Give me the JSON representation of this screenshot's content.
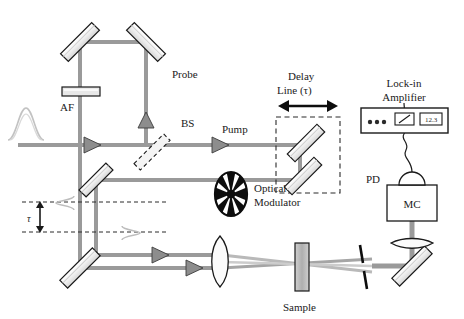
{
  "figure": {
    "type": "optical-setup-diagram",
    "background": "#ffffff"
  },
  "colors": {
    "beam": "#9a9a9a",
    "beam_light": "#c9c9c9",
    "outline": "#1a1a1a",
    "mirror_face": "#eeeeee",
    "component_fill": "#b5b5b5",
    "text": "#1a1a1a",
    "dashed": "#2a2a2a"
  },
  "labels": {
    "probe": "Probe",
    "pump": "Pump",
    "af": "AF",
    "bs": "BS",
    "delay_line": "Delay",
    "delay_line_2": "Line (τ)",
    "lockin": "Lock-in",
    "lockin_2": "Amplifier",
    "optical_modulator": "Optical",
    "optical_modulator_2": "Modulator",
    "pd": "PD",
    "mc": "MC",
    "sample": "Sample",
    "tau": "τ"
  },
  "lockin_amplifier": {
    "display_value": "12.3",
    "knob_count": 3,
    "meter": "analog-needle-meter"
  },
  "components": [
    {
      "name": "mirror-top-left",
      "type": "mirror",
      "angle": -45
    },
    {
      "name": "mirror-top-right",
      "type": "mirror",
      "angle": 45
    },
    {
      "name": "mirror-bottom-left",
      "type": "mirror",
      "angle": -45
    },
    {
      "name": "mirror-delay-upper",
      "type": "mirror",
      "angle": -45
    },
    {
      "name": "mirror-delay-lower",
      "type": "mirror",
      "angle": -45
    },
    {
      "name": "mirror-detector",
      "type": "mirror",
      "angle": -45
    },
    {
      "name": "beam-splitter",
      "type": "beamsplitter",
      "angle": -45
    },
    {
      "name": "af-filter",
      "type": "filter"
    },
    {
      "name": "sample",
      "type": "sample-cuvette"
    },
    {
      "name": "aperture",
      "type": "slit"
    },
    {
      "name": "lens-focus",
      "type": "lens"
    },
    {
      "name": "lens-collect",
      "type": "lens"
    },
    {
      "name": "optical-modulator",
      "type": "chopper-wheel",
      "blades": 8
    },
    {
      "name": "monochromator",
      "type": "box"
    },
    {
      "name": "photodiode",
      "type": "dome"
    }
  ]
}
